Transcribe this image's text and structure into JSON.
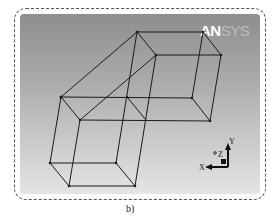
{
  "logo": {
    "primary": "AN",
    "secondary": "SYS"
  },
  "triad": {
    "x_label": "X",
    "y_label": "Y",
    "z_label": "Z"
  },
  "caption": "b)",
  "colors": {
    "wire": "#1a1a1a",
    "background_top": "#8e8e8e",
    "background_bottom": "#e4e4e4",
    "triad_x": "#111111",
    "triad_y": "#111111"
  }
}
